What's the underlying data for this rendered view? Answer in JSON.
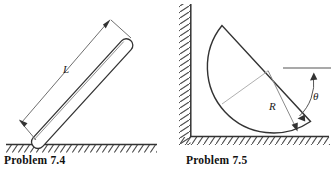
{
  "page": {
    "width": 331,
    "height": 171,
    "background": "#ffffff",
    "ink": "#333333"
  },
  "figures": [
    {
      "id": "problem-7-4",
      "caption": "Problem 7.4",
      "description": "A uniform rod leaning against the ground at an angle, with its length dimensioned",
      "labels": [
        {
          "name": "length-label",
          "text": "L",
          "x": 66,
          "y": 70,
          "style": "italic"
        }
      ],
      "geometry": {
        "ground_line_y": 144,
        "ground_x_start": 6,
        "ground_x_end": 157,
        "rod_start": [
          38,
          142
        ],
        "rod_end": [
          131,
          40
        ],
        "rod_thickness": 9,
        "dimension_arrow_top": [
          110,
          19
        ],
        "dimension_arrow_bottom": [
          19,
          119
        ]
      }
    },
    {
      "id": "problem-7-5",
      "caption": "Problem 7.5",
      "description": "A semicircular disc resting in the corner between a vertical wall and the floor, with radius R and angle theta marked from the horizontal",
      "labels": [
        {
          "name": "radius-label",
          "text": "R",
          "x": 272,
          "y": 108,
          "style": "italic"
        },
        {
          "name": "angle-label",
          "text": "θ",
          "x": 316,
          "y": 97,
          "style": "italic"
        }
      ],
      "geometry": {
        "wall_x": 191,
        "wall_y_top": 4,
        "floor_y": 136,
        "floor_x_end": 329,
        "disc_center": [
          268,
          71
        ],
        "disc_radius": 66,
        "diameter_start": [
          222,
          25
        ],
        "diameter_end": [
          311,
          121
        ],
        "horizontal_ref_y": 68,
        "horizontal_ref_x_start": 283,
        "horizontal_ref_x_end": 331
      }
    }
  ],
  "colors": {
    "ink": "#333333",
    "light_ink": "#8c8c8c",
    "hatch": "#4d4d4d",
    "text": "#111111"
  }
}
